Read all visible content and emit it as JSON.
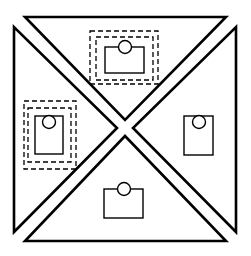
{
  "diagram": {
    "colors": {
      "stroke": "#000000",
      "background": "#ffffff"
    },
    "regions": [
      {
        "id": "top",
        "points": "25,17 226,17 125,120",
        "rect": {
          "x": 105,
          "y": 47,
          "w": 39,
          "h": 26
        },
        "circle": {
          "cx": 125,
          "cy": 47,
          "r": 6.5
        },
        "selected": true,
        "dashed": [
          {
            "x": 96,
            "y": 37,
            "w": 57,
            "h": 43
          },
          {
            "x": 90,
            "y": 31,
            "w": 68,
            "h": 53
          }
        ]
      },
      {
        "id": "left",
        "points": "14,27 14,232 117,128",
        "rect": {
          "x": 35,
          "y": 116,
          "w": 28,
          "h": 38
        },
        "circle": {
          "cx": 49,
          "cy": 122,
          "r": 6.5
        },
        "selected": true,
        "dashed": [
          {
            "x": 28,
            "y": 108,
            "w": 43,
            "h": 54
          },
          {
            "x": 24,
            "y": 101,
            "w": 52,
            "h": 68
          }
        ]
      },
      {
        "id": "right",
        "points": "236,27 236,232 133,128",
        "rect": {
          "x": 184,
          "y": 116,
          "w": 29,
          "h": 39
        },
        "circle": {
          "cx": 199,
          "cy": 122,
          "r": 6.5
        },
        "selected": false,
        "dashed": []
      },
      {
        "id": "bottom",
        "points": "25,241 226,241 125,136",
        "rect": {
          "x": 104,
          "y": 189,
          "w": 39,
          "h": 29
        },
        "circle": {
          "cx": 124,
          "cy": 189,
          "r": 6.5
        },
        "selected": false,
        "dashed": []
      }
    ]
  }
}
